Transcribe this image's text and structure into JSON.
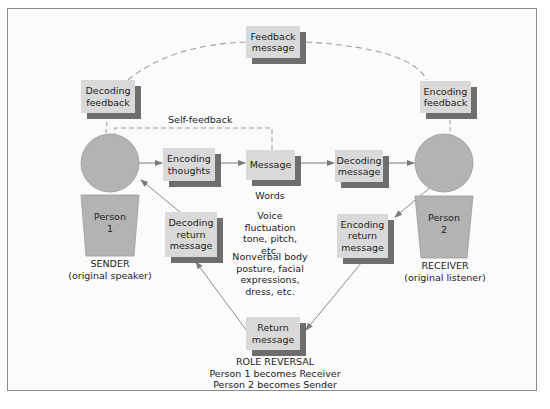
{
  "diagram": {
    "nodes": {
      "feedback_message": "Feedback message",
      "decoding_feedback": "Decoding feedback",
      "encoding_feedback": "Encoding feedback",
      "encoding_thoughts": "Encoding thoughts",
      "message": "Message",
      "decoding_message": "Decoding message",
      "decoding_return_message": "Decoding return message",
      "encoding_return_message": "Encoding return message",
      "return_message": "Return message"
    },
    "labels": {
      "self_feedback": "Self-feedback",
      "words": "Words",
      "voice": "Voice fluctuation tone, pitch, etc.",
      "nonverbal": "Nonverbal body posture, facial expressions, dress, etc."
    },
    "person1": {
      "name": "Person",
      "number": "1",
      "role": "SENDER",
      "role_detail": "(original speaker)"
    },
    "person2": {
      "name": "Person",
      "number": "2",
      "role": "RECEIVER",
      "role_detail": "(original listener)"
    },
    "role_reversal": {
      "title": "ROLE REVERSAL",
      "line1": "Person 1 becomes Receiver",
      "line2": "Person 2 becomes Sender"
    },
    "colors": {
      "box_fill": "#d9d9d9",
      "box_shadow": "#6e6e6e",
      "person_fill": "#b3b3b3",
      "line": "#8a8a8a",
      "dashed_line": "#a0a0a0"
    }
  }
}
